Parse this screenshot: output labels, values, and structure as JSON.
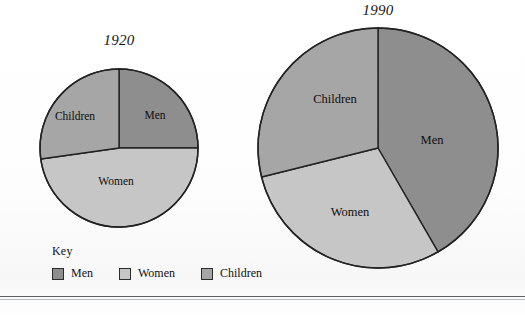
{
  "figure": {
    "background_color": "#ffffff",
    "line_color": "#222222"
  },
  "colors": {
    "men": "#8e8e8e",
    "women": "#c6c6c6",
    "children": "#a6a6a6",
    "outline": "#222222"
  },
  "key": {
    "heading": "Key",
    "items": [
      {
        "label": "Men",
        "color": "#8e8e8e",
        "swatch_name": "men-swatch"
      },
      {
        "label": "Women",
        "color": "#c6c6c6",
        "swatch_name": "women-swatch"
      },
      {
        "label": "Children",
        "color": "#a6a6a6",
        "swatch_name": "children-swatch"
      }
    ]
  },
  "charts": [
    {
      "id": "chart-1920",
      "title": "1920",
      "labels": {
        "men": "Men",
        "women": "Women",
        "children": "Children"
      }
    },
    {
      "id": "chart-1990",
      "title": "1990",
      "labels": {
        "men": "Men",
        "women": "Women",
        "children": "Children"
      }
    }
  ],
  "chart_data": [
    {
      "type": "pie",
      "title": "1920",
      "categories": [
        "Men",
        "Women",
        "Children"
      ],
      "values": [
        25,
        48,
        27
      ],
      "unit": "percent",
      "start_angle_deg": 0,
      "direction": "clockwise",
      "segment_angles_deg": [
        {
          "name": "Men",
          "start": 0,
          "end": 90
        },
        {
          "name": "Women",
          "start": 90,
          "end": 262
        },
        {
          "name": "Children",
          "start": 262,
          "end": 360
        }
      ],
      "colors": [
        "#8e8e8e",
        "#c6c6c6",
        "#a6a6a6"
      ],
      "legend": [
        "Men",
        "Women",
        "Children"
      ],
      "legend_position": "bottom-left",
      "radius_px": 79,
      "grid": false
    },
    {
      "type": "pie",
      "title": "1990",
      "categories": [
        "Men",
        "Women",
        "Children"
      ],
      "values": [
        42,
        29,
        29
      ],
      "unit": "percent",
      "start_angle_deg": 0,
      "direction": "clockwise",
      "segment_angles_deg": [
        {
          "name": "Men",
          "start": 0,
          "end": 150
        },
        {
          "name": "Women",
          "start": 150,
          "end": 256
        },
        {
          "name": "Children",
          "start": 256,
          "end": 360
        }
      ],
      "colors": [
        "#8e8e8e",
        "#c6c6c6",
        "#a6a6a6"
      ],
      "legend": [
        "Men",
        "Women",
        "Children"
      ],
      "legend_position": "bottom-left",
      "radius_px": 120,
      "grid": false
    }
  ]
}
